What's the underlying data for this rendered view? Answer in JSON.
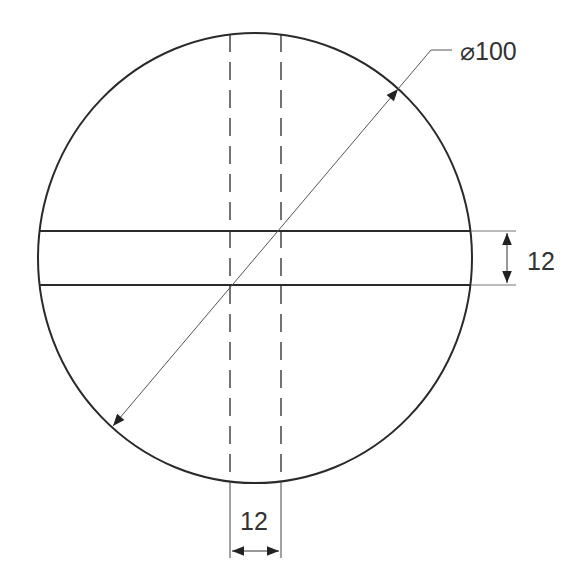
{
  "drawing": {
    "type": "engineering-drawing",
    "subject": "circular disc with slot (top view)",
    "colors": {
      "line": "#2a2a2a",
      "thin": "#555555",
      "background": "#ffffff"
    },
    "circle": {
      "cx": 255,
      "cy": 258,
      "rx": 217,
      "ry": 225
    },
    "slot": {
      "top_y": 231,
      "bottom_y": 285
    },
    "hidden_lines": {
      "left_x": 230,
      "right_x": 281
    },
    "dimensions": {
      "diameter": {
        "label": "⌀100",
        "value": 100,
        "symbol": "diameter-icon"
      },
      "slot_width_horizontal": {
        "label": "12",
        "value": 12
      },
      "slot_width_vertical": {
        "label": "12",
        "value": 12
      }
    }
  }
}
